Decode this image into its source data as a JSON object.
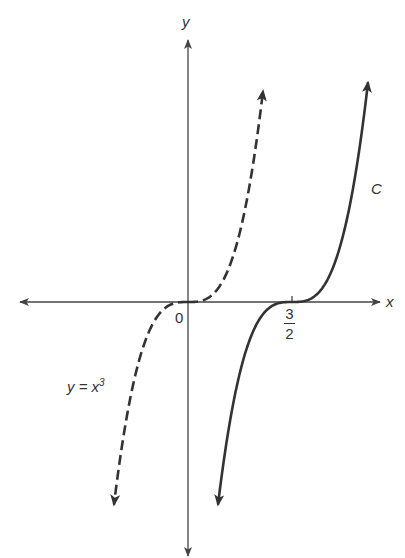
{
  "figure": {
    "axes": {
      "x_label": "x",
      "y_label": "y",
      "origin_label": "0",
      "tick": {
        "numerator": "3",
        "denominator": "2",
        "value": 1.5
      }
    },
    "curves": [
      {
        "name": "y = x^3",
        "label_base": "y = x",
        "label_exp": "3",
        "style": "dashed",
        "equation": "y = x^3"
      },
      {
        "name": "C",
        "label": "C",
        "style": "solid",
        "equation": "y = (x - 3/2)^3"
      }
    ],
    "colors": {
      "ink": "#333333",
      "axis": "#444444",
      "background": "#ffffff"
    }
  },
  "chart_data": {
    "type": "line",
    "title": "",
    "xlabel": "x",
    "ylabel": "y",
    "grid": false,
    "legend": "inline labels",
    "x_ticks": [
      {
        "value": 0,
        "label": "0"
      },
      {
        "value": 1.5,
        "label": "3/2"
      }
    ],
    "series": [
      {
        "name": "y = x^3",
        "style": "dashed",
        "function": "x^3",
        "x": [
          -1.07,
          -0.75,
          -0.5,
          0,
          0.5,
          0.75,
          1.08
        ],
        "y": [
          -1.22,
          -0.42,
          -0.125,
          0,
          0.125,
          0.42,
          1.26
        ]
      },
      {
        "name": "C",
        "style": "solid",
        "function": "(x - 1.5)^3",
        "x": [
          0.43,
          0.75,
          1.0,
          1.5,
          2.0,
          2.25,
          2.59
        ],
        "y": [
          -1.22,
          -0.42,
          -0.125,
          0,
          0.125,
          0.42,
          1.29
        ]
      }
    ]
  }
}
